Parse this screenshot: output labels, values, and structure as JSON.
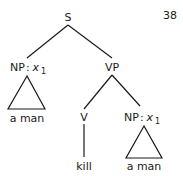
{
  "page_number": "38",
  "tree": {
    "root": {
      "label": "S"
    },
    "np_subject": {
      "category": "NP",
      "separator": ":",
      "variable": "x",
      "subscript": "1",
      "yield": "a man"
    },
    "vp": {
      "label": "VP"
    },
    "verb": {
      "label": "V",
      "word": "kill"
    },
    "np_object": {
      "category": "NP",
      "separator": ":",
      "variable": "x",
      "subscript": "1",
      "yield": "a man"
    }
  },
  "colors": {
    "ink": "#1a1a1a",
    "background": "#ffffff"
  }
}
